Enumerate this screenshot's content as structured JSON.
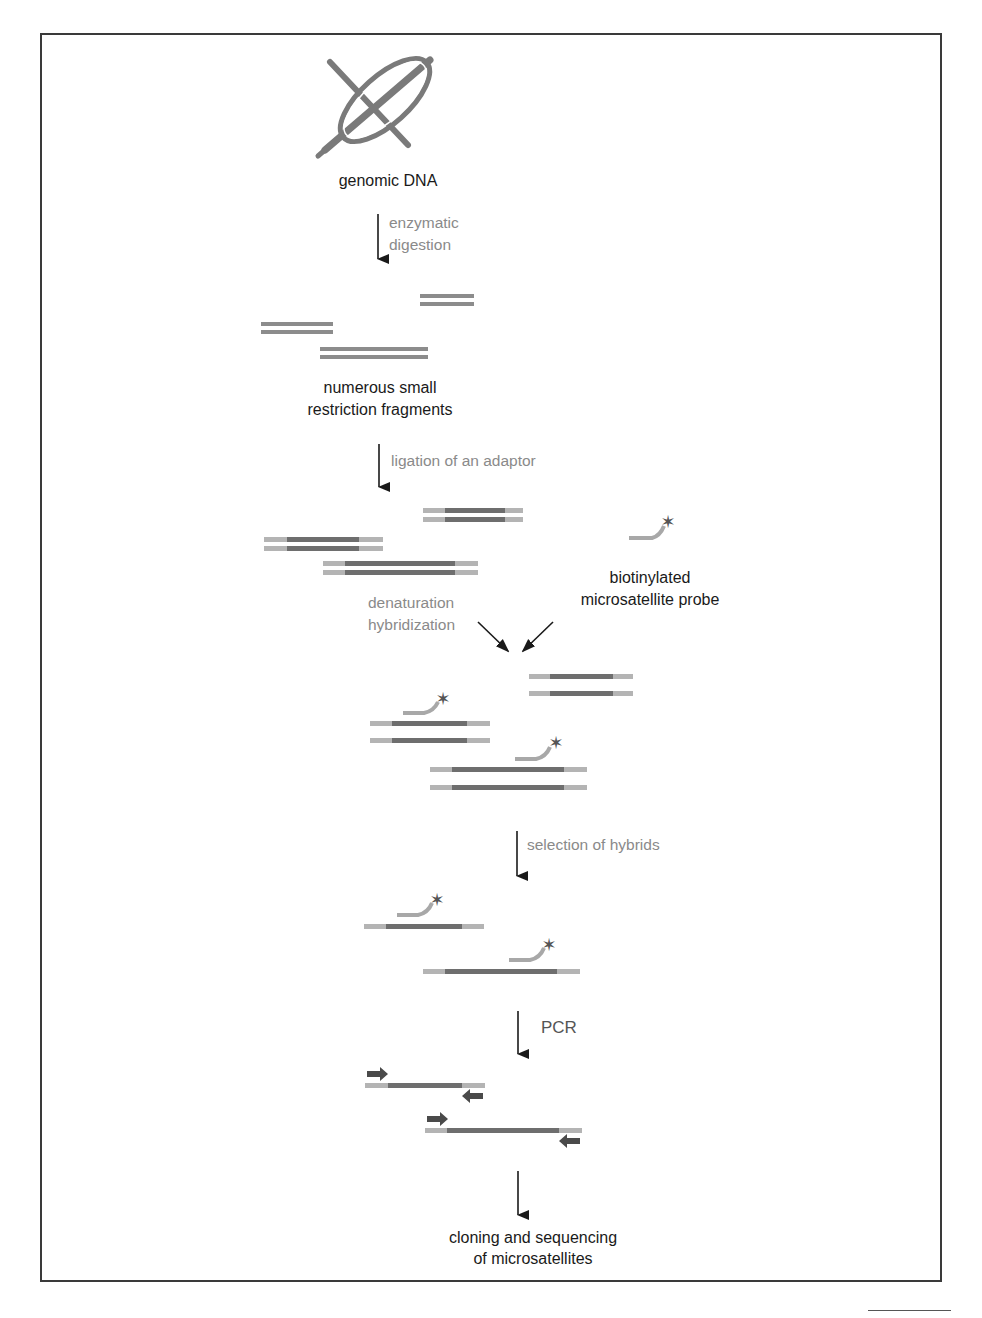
{
  "diagram": {
    "nodes": {
      "genomic_dna": "genomic DNA",
      "fragments_line1": "numerous small",
      "fragments_line2": "restriction fragments",
      "probe_line1": "biotinylated",
      "probe_line2": "microsatellite probe",
      "final_line1": "cloning and sequencing",
      "final_line2": "of microsatellites"
    },
    "steps": {
      "digestion_line1": "enzymatic",
      "digestion_line2": "digestion",
      "ligation": "ligation of an adaptor",
      "denaturation_line1": "denaturation",
      "denaturation_line2": "hybridization",
      "selection": "selection of hybrids",
      "pcr": "PCR"
    },
    "colors": {
      "strand": "#8c8c8c",
      "strand_dark": "#6e6e6e",
      "adaptor": "#b4b4b4",
      "probe": "#a8a8a8",
      "star": "#555555",
      "arrow": "#1a1a1a",
      "primer": "#4a4a4a",
      "frame": "#3a3a3a"
    }
  }
}
